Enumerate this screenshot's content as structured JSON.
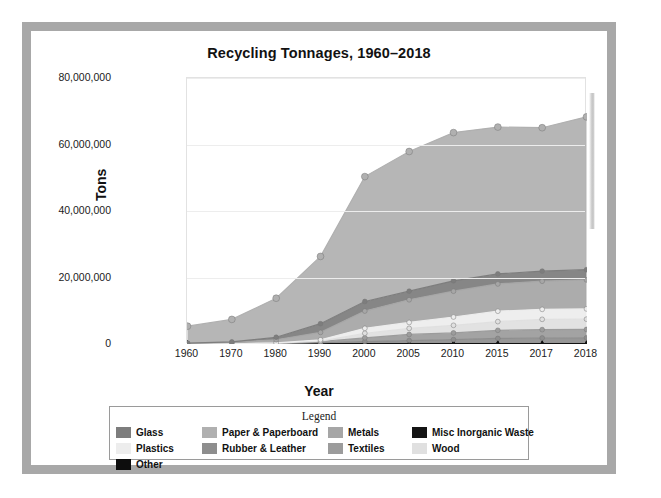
{
  "window": {
    "frame_color": "#a8a8a8",
    "background": "#ffffff"
  },
  "chart": {
    "title": "Recycling Tonnages, 1960–2018",
    "xlabel": "Year",
    "ylabel": "Tons",
    "legend_title": "Legend",
    "ytick_labels": [
      "0",
      "20,000,000",
      "40,000,000",
      "60,000,000",
      "80,000,000"
    ]
  },
  "chart_data": {
    "type": "area",
    "stacked": true,
    "title": "Recycling Tonnages, 1960–2018",
    "xlabel": "Year",
    "ylabel": "Tons",
    "legend_position": "bottom",
    "grid": true,
    "categories": [
      "1960",
      "1970",
      "1980",
      "1990",
      "2000",
      "2005",
      "2010",
      "2015",
      "2017",
      "2018"
    ],
    "ylim": [
      0,
      80000000
    ],
    "yticks": [
      0,
      20000000,
      40000000,
      60000000,
      80000000
    ],
    "ytick_labels": [
      "0",
      "20,000,000",
      "40,000,000",
      "60,000,000",
      "80,000,000"
    ],
    "series": [
      {
        "name": "Other",
        "color": "#0d0d0d",
        "values": [
          0,
          0,
          0,
          0,
          0,
          0,
          0,
          0,
          0,
          0
        ]
      },
      {
        "name": "Misc Inorganic Waste",
        "color": "#141414",
        "values": [
          0,
          0,
          0,
          0,
          0,
          0,
          0,
          0,
          0,
          0
        ]
      },
      {
        "name": "Rubber & Leather",
        "color": "#8e8e8e",
        "values": [
          0,
          0,
          130000,
          370000,
          740000,
          1040000,
          1320000,
          1670000,
          1810000,
          1860000
        ]
      },
      {
        "name": "Textiles",
        "color": "#9c9c9c",
        "values": [
          50000,
          60000,
          160000,
          390000,
          1130000,
          1830000,
          2020000,
          2450000,
          2510000,
          2510000
        ]
      },
      {
        "name": "Wood",
        "color": "#e0e0e0",
        "values": [
          0,
          0,
          0,
          130000,
          1370000,
          1830000,
          2280000,
          2620000,
          3100000,
          3100000
        ]
      },
      {
        "name": "Plastics",
        "color": "#ededed",
        "values": [
          0,
          0,
          20000,
          370000,
          1480000,
          1780000,
          2500000,
          3120000,
          3000000,
          3090000
        ]
      },
      {
        "name": "Metals",
        "color": "#a6a6a6",
        "values": [
          130000,
          410000,
          970000,
          2230000,
          5190000,
          6820000,
          7760000,
          8200000,
          8460000,
          8720000
        ]
      },
      {
        "name": "Glass",
        "color": "#7d7d7d",
        "values": [
          100000,
          160000,
          750000,
          2620000,
          2880000,
          2590000,
          3130000,
          3030000,
          3030000,
          3060000
        ]
      },
      {
        "name": "Paper & Paperboard",
        "color": "#b0b0b0",
        "values": [
          5080000,
          6770000,
          11740000,
          20230000,
          37560000,
          42000000,
          44570000,
          44160000,
          43140000,
          45970000
        ]
      }
    ],
    "totals": [
      5360000,
      7400000,
      13770000,
      26340000,
      50350000,
      57890000,
      63580000,
      65250000,
      65050000,
      66310000
    ]
  },
  "legend": {
    "items": [
      {
        "label": "Glass",
        "color": "#7d7d7d"
      },
      {
        "label": "Paper & Paperboard",
        "color": "#b0b0b0"
      },
      {
        "label": "Metals",
        "color": "#a6a6a6"
      },
      {
        "label": "Misc Inorganic Waste",
        "color": "#141414"
      },
      {
        "label": "Plastics",
        "color": "#ededed"
      },
      {
        "label": "Rubber & Leather",
        "color": "#8e8e8e"
      },
      {
        "label": "Textiles",
        "color": "#9c9c9c"
      },
      {
        "label": "Wood",
        "color": "#e0e0e0"
      },
      {
        "label": "Other",
        "color": "#0d0d0d"
      }
    ]
  }
}
